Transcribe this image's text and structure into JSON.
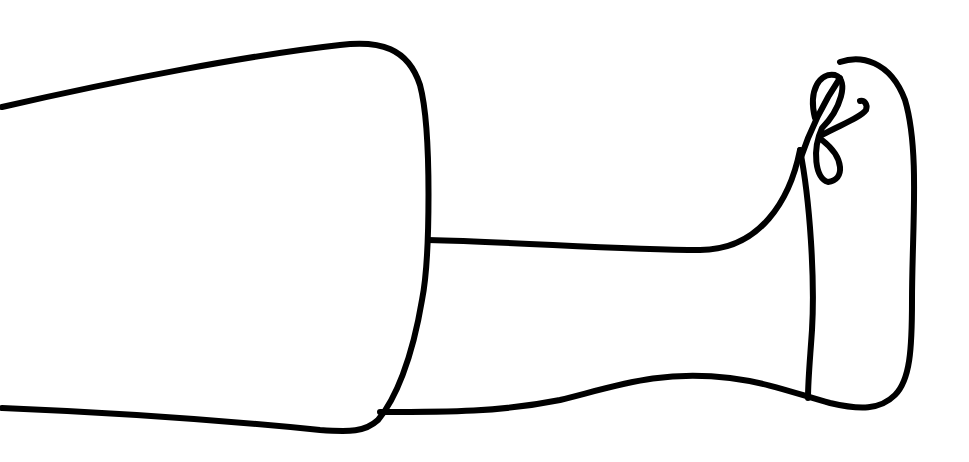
{
  "drawing": {
    "subject": "leg-with-shoe-line-art",
    "background": "#ffffff",
    "stroke_color": "#000000"
  }
}
